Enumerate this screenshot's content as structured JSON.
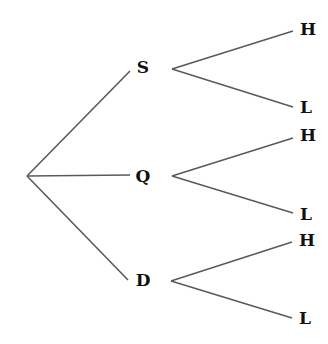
{
  "diagram": {
    "type": "tree",
    "root": {
      "x": 27,
      "y": 176
    },
    "level1": [
      {
        "label": "S",
        "x": 143,
        "y": 67,
        "edge_end": {
          "x": 130,
          "y": 71
        },
        "branch_start": {
          "x": 172,
          "y": 69
        }
      },
      {
        "label": "Q",
        "x": 143,
        "y": 176,
        "edge_end": {
          "x": 130,
          "y": 175
        },
        "branch_start": {
          "x": 172,
          "y": 176
        }
      },
      {
        "label": "D",
        "x": 143,
        "y": 280,
        "edge_end": {
          "x": 128,
          "y": 280
        },
        "branch_start": {
          "x": 171,
          "y": 281
        }
      }
    ],
    "level2": [
      {
        "parent": "S",
        "label": "H",
        "x": 308,
        "y": 29,
        "edge_end": {
          "x": 293,
          "y": 31
        }
      },
      {
        "parent": "S",
        "label": "L",
        "x": 306,
        "y": 107,
        "edge_end": {
          "x": 293,
          "y": 107
        }
      },
      {
        "parent": "Q",
        "label": "H",
        "x": 308,
        "y": 135,
        "edge_end": {
          "x": 293,
          "y": 138
        }
      },
      {
        "parent": "Q",
        "label": "L",
        "x": 306,
        "y": 214,
        "edge_end": {
          "x": 293,
          "y": 213
        }
      },
      {
        "parent": "D",
        "label": "H",
        "x": 307,
        "y": 240,
        "edge_end": {
          "x": 292,
          "y": 242
        }
      },
      {
        "parent": "D",
        "label": "L",
        "x": 305,
        "y": 318,
        "edge_end": {
          "x": 292,
          "y": 318
        }
      }
    ]
  }
}
